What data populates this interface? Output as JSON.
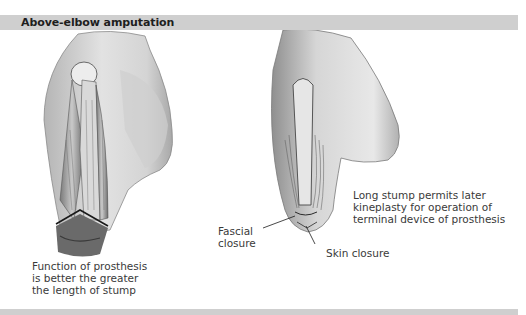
{
  "header": {
    "title": "Above-elbow amputation"
  },
  "figures": {
    "left": {
      "description": "Arm with above-elbow amputation showing humerus, muscles and cut line at distal end",
      "caption_lines": [
        "Function of prosthesis",
        "is better the greater",
        "the length of stump"
      ]
    },
    "right": {
      "description": "Closed long stump after amputation showing fascial and skin closure",
      "caption_lines": [
        "Long stump permits later",
        "kineplasty for operation of",
        "terminal device of prosthesis"
      ],
      "labels": {
        "fascial_closure": [
          "Fascial",
          "closure"
        ],
        "skin_closure": "Skin closure"
      }
    }
  },
  "colors": {
    "header_bar": "#cfcfcf",
    "title_text": "#1e1e1e",
    "body_text": "#3a3a3a",
    "skin_light": "#e6e6e6",
    "skin_shade": "#9a9a9a",
    "muscle_dark": "#5a5a5a"
  }
}
